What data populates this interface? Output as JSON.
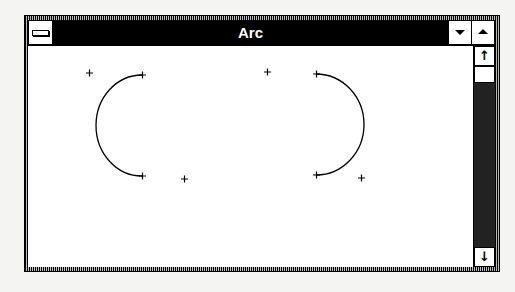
{
  "window": {
    "title": "Arc",
    "system_menu_icon": "system-menu-icon",
    "minimize_icon": "triangle-down-icon",
    "maximize_icon": "triangle-up-icon"
  },
  "scrollbar": {
    "orientation": "vertical",
    "up_arrow": "↑",
    "down_arrow": "↓",
    "thumb_position": "top"
  },
  "canvas": {
    "arcs": [
      {
        "name": "left-arc",
        "start": [
          142,
          75
        ],
        "end": [
          142,
          176
        ],
        "direction": "counterclockwise-left",
        "bounding_markers": [
          [
            89,
            73
          ],
          [
            184,
            179
          ]
        ],
        "endpoint_markers": [
          [
            142,
            75
          ],
          [
            142,
            176
          ]
        ]
      },
      {
        "name": "right-arc",
        "start": [
          316,
          74
        ],
        "end": [
          316,
          175
        ],
        "direction": "clockwise-right",
        "bounding_markers": [
          [
            267,
            72
          ],
          [
            361,
            178
          ]
        ],
        "endpoint_markers": [
          [
            316,
            74
          ],
          [
            316,
            175
          ]
        ]
      }
    ],
    "marker_glyph": "+",
    "line_color": "#000000",
    "background": "#ffffff"
  },
  "colors": {
    "titlebar": "#000000",
    "title_text": "#ffffff",
    "client_bg": "#ffffff",
    "desktop": "#f4f4f2"
  }
}
